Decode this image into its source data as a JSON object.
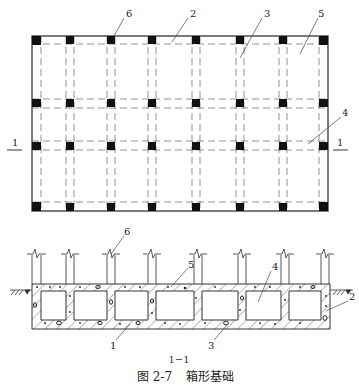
{
  "figure": {
    "caption_number": "图 2-7",
    "caption_title": "箱形基础",
    "section_label": "1−1"
  },
  "plan": {
    "section_mark_left": "1",
    "section_mark_right": "1",
    "columns_x": [
      32,
      70,
      111,
      152,
      196,
      240,
      283,
      322
    ],
    "rows_y": [
      41,
      104,
      145,
      207
    ],
    "callouts": [
      {
        "label": "6",
        "lx": 124,
        "ly": 17
      },
      {
        "label": "2",
        "lx": 190,
        "ly": 17
      },
      {
        "label": "3",
        "lx": 266,
        "ly": 17
      },
      {
        "label": "5",
        "lx": 320,
        "ly": 17
      },
      {
        "label": "4",
        "lx": 344,
        "ly": 116
      },
      {
        "label": "1",
        "lx": 10,
        "ly": 148
      },
      {
        "label": "1",
        "lx": 340,
        "ly": 148
      }
    ]
  },
  "section": {
    "callouts": [
      {
        "label": "6",
        "lx": 125,
        "ly": 358
      },
      {
        "label": "5",
        "lx": 188,
        "ly": 268
      },
      {
        "label": "4",
        "lx": 273,
        "ly": 270
      },
      {
        "label": "2",
        "lx": 351,
        "ly": 300
      },
      {
        "label": "1",
        "lx": 113,
        "ly": 345
      },
      {
        "label": "3",
        "lx": 215,
        "ly": 345
      }
    ]
  },
  "legend_parts": {
    "1": "底板",
    "2": "外墙",
    "3": "内墙",
    "4": "内隔墙",
    "5": "顶板",
    "6": "柱"
  }
}
